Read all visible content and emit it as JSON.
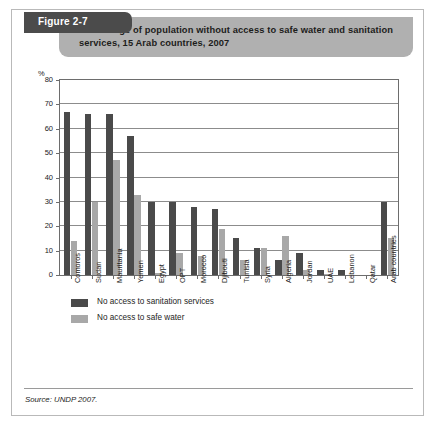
{
  "figure": {
    "tab_label": "Figure 2-7",
    "title": "Percentage of population without access to safe water and sanitation services, 15 Arab countries, 2007",
    "source": "Source: UNDP 2007.",
    "tab_color": "#4b4b4b",
    "banner_color": "#b0b0b0"
  },
  "legend": {
    "items": [
      {
        "label": "No access to sanitation services",
        "color": "#4a4a4a"
      },
      {
        "label": "No access to safe water",
        "color": "#a8a8a8"
      }
    ]
  },
  "chart_data": {
    "type": "bar",
    "title": "Percentage of population without access to safe water and sanitation services, 15 Arab countries, 2007",
    "xlabel": "",
    "ylabel": "%",
    "ylim": [
      0,
      80
    ],
    "yticks": [
      0,
      10,
      20,
      30,
      40,
      50,
      60,
      70,
      80
    ],
    "grid": true,
    "legend_position": "below",
    "categories": [
      "Comoros",
      "Sudan",
      "Mauritania",
      "Yemen",
      "Egypt",
      "OPT",
      "Morocco",
      "Djibouti",
      "Tunisia",
      "Syria",
      "Algeria",
      "Jordan",
      "UAE",
      "Lebanon",
      "Qatar",
      "Arab countries"
    ],
    "series": [
      {
        "name": "No access to sanitation services",
        "color": "#4a4a4a",
        "values": [
          67,
          66,
          66,
          57,
          30,
          30,
          28,
          27,
          15,
          11,
          6,
          9,
          2,
          2,
          0,
          30
        ]
      },
      {
        "name": "No access to safe water",
        "color": "#a8a8a8",
        "values": [
          14,
          30,
          47,
          33,
          1,
          9,
          8,
          19,
          6,
          11,
          16,
          2,
          0.5,
          0,
          0,
          15
        ]
      }
    ]
  }
}
